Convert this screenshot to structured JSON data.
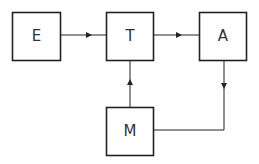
{
  "diagram": {
    "nodes": [
      {
        "id": "E",
        "label": "E"
      },
      {
        "id": "T",
        "label": "T"
      },
      {
        "id": "A",
        "label": "A"
      },
      {
        "id": "M",
        "label": "M"
      }
    ],
    "edges": [
      {
        "from": "E",
        "to": "T"
      },
      {
        "from": "T",
        "to": "A"
      },
      {
        "from": "M",
        "to": "T"
      },
      {
        "from": "A",
        "to": "M"
      }
    ]
  }
}
